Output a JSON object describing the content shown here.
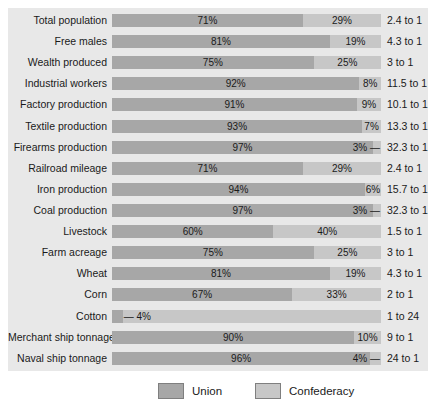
{
  "chart_data": {
    "type": "bar",
    "orientation": "horizontal",
    "stacked": true,
    "title": "",
    "xlabel": "",
    "ylabel": "",
    "unit": "percent share of total (Union vs Confederacy)",
    "legend_entries": [
      "Union",
      "Confederacy"
    ],
    "legend_position": "bottom",
    "grid": false,
    "colors": {
      "union": "#a7a7a7",
      "confederacy": "#c7c7c7",
      "panel_background": "#e8e8e8",
      "swatch_border": "#7f7f7f",
      "text": "#1a1a1a"
    },
    "categories": [
      "Total population",
      "Free males",
      "Wealth produced",
      "Industrial workers",
      "Factory production",
      "Textile production",
      "Firearms production",
      "Railroad mileage",
      "Iron production",
      "Coal production",
      "Livestock",
      "Farm acreage",
      "Wheat",
      "Corn",
      "Cotton",
      "Merchant ship tonnage",
      "Naval ship tonnage"
    ],
    "series": [
      {
        "name": "Union",
        "values": [
          71,
          81,
          75,
          92,
          91,
          93,
          97,
          71,
          94,
          97,
          60,
          75,
          81,
          67,
          4,
          90,
          96
        ]
      },
      {
        "name": "Confederacy",
        "values": [
          29,
          19,
          25,
          8,
          9,
          7,
          3,
          29,
          6,
          3,
          40,
          25,
          19,
          33,
          96,
          10,
          4
        ]
      }
    ],
    "rows": [
      {
        "category": "Total population",
        "union_pct": 71,
        "confederacy_pct": 29,
        "union_display": "71%",
        "confederacy_display": "29%",
        "ratio": "2.4 to 1"
      },
      {
        "category": "Free males",
        "union_pct": 81,
        "confederacy_pct": 19,
        "union_display": "81%",
        "confederacy_display": "19%",
        "ratio": "4.3 to 1"
      },
      {
        "category": "Wealth produced",
        "union_pct": 75,
        "confederacy_pct": 25,
        "union_display": "75%",
        "confederacy_display": "25%",
        "ratio": "3 to 1"
      },
      {
        "category": "Industrial workers",
        "union_pct": 92,
        "confederacy_pct": 8,
        "union_display": "92%",
        "confederacy_display": "8%",
        "ratio": "11.5 to 1"
      },
      {
        "category": "Factory production",
        "union_pct": 91,
        "confederacy_pct": 9,
        "union_display": "91%",
        "confederacy_display": "9%",
        "ratio": "10.1 to 1"
      },
      {
        "category": "Textile production",
        "union_pct": 93,
        "confederacy_pct": 7,
        "union_display": "93%",
        "confederacy_display": "7%",
        "ratio": "13.3 to 1"
      },
      {
        "category": "Firearms production",
        "union_pct": 97,
        "confederacy_pct": 3,
        "union_display": "97%",
        "confederacy_display": "3% —",
        "ratio": "32.3 to 1"
      },
      {
        "category": "Railroad mileage",
        "union_pct": 71,
        "confederacy_pct": 29,
        "union_display": "71%",
        "confederacy_display": "29%",
        "ratio": "2.4 to 1"
      },
      {
        "category": "Iron production",
        "union_pct": 94,
        "confederacy_pct": 6,
        "union_display": "94%",
        "confederacy_display": "6%",
        "ratio": "15.7 to 1"
      },
      {
        "category": "Coal production",
        "union_pct": 97,
        "confederacy_pct": 3,
        "union_display": "97%",
        "confederacy_display": "3% —",
        "ratio": "32.3 to 1"
      },
      {
        "category": "Livestock",
        "union_pct": 60,
        "confederacy_pct": 40,
        "union_display": "60%",
        "confederacy_display": "40%",
        "ratio": "1.5 to 1"
      },
      {
        "category": "Farm acreage",
        "union_pct": 75,
        "confederacy_pct": 25,
        "union_display": "75%",
        "confederacy_display": "25%",
        "ratio": "3 to 1"
      },
      {
        "category": "Wheat",
        "union_pct": 81,
        "confederacy_pct": 19,
        "union_display": "81%",
        "confederacy_display": "19%",
        "ratio": "4.3 to 1"
      },
      {
        "category": "Corn",
        "union_pct": 67,
        "confederacy_pct": 33,
        "union_display": "67%",
        "confederacy_display": "33%",
        "ratio": "2 to 1"
      },
      {
        "category": "Cotton",
        "union_pct": 4,
        "confederacy_pct": 96,
        "union_display": "— 4%",
        "confederacy_display": "96%",
        "ratio": "1 to 24"
      },
      {
        "category": "Merchant ship tonnage",
        "union_pct": 90,
        "confederacy_pct": 10,
        "union_display": "90%",
        "confederacy_display": "10%",
        "ratio": "9 to 1"
      },
      {
        "category": "Naval ship tonnage",
        "union_pct": 96,
        "confederacy_pct": 4,
        "union_display": "96%",
        "confederacy_display": "4% —",
        "ratio": "24 to 1"
      }
    ]
  },
  "legend": {
    "union": "Union",
    "confederacy": "Confederacy"
  }
}
